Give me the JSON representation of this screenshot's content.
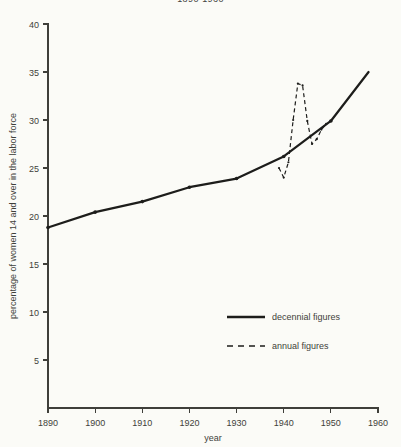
{
  "chart_data": {
    "type": "line",
    "title": "1890-1960",
    "xlabel": "year",
    "ylabel": "percentage of women 14 and over in the labor force",
    "xlim": [
      1890,
      1960
    ],
    "ylim": [
      0,
      40
    ],
    "xticks": [
      1890,
      1900,
      1910,
      1920,
      1930,
      1940,
      1950,
      1960
    ],
    "xtick_labels": [
      "1890",
      "1900",
      "1910",
      "1920",
      "1930",
      "1940",
      "1950",
      "1960"
    ],
    "yticks": [
      5,
      10,
      15,
      20,
      25,
      30,
      35,
      40
    ],
    "ytick_labels": [
      "5",
      "10",
      "15",
      "20",
      "25",
      "30",
      "35",
      "40"
    ],
    "grid": false,
    "legend_position": "center-right",
    "series": [
      {
        "name": "decennial figures",
        "style": "solid",
        "x": [
          1890,
          1900,
          1910,
          1920,
          1930,
          1940,
          1950,
          1958
        ],
        "values": [
          18.8,
          20.4,
          21.5,
          23.0,
          23.9,
          26.2,
          29.9,
          35.0
        ]
      },
      {
        "name": "annual figures",
        "style": "dashed",
        "x": [
          1939,
          1940,
          1941,
          1942,
          1943,
          1944,
          1945,
          1946,
          1947,
          1948,
          1949
        ],
        "values": [
          25.0,
          24.0,
          25.6,
          30.0,
          33.8,
          33.6,
          29.9,
          27.5,
          28.0,
          29.0,
          29.6
        ]
      }
    ],
    "legend": [
      {
        "label": "decennial figures",
        "style": "solid"
      },
      {
        "label": "annual figures",
        "style": "dashed"
      }
    ]
  }
}
